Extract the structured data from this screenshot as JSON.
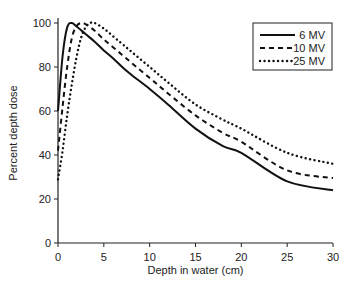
{
  "chart_data": {
    "type": "line",
    "title": "",
    "xlabel": "Depth in water (cm)",
    "ylabel": "Percent depth dose",
    "xlim": [
      0,
      30
    ],
    "ylim": [
      0,
      100
    ],
    "xticks": [
      0,
      5,
      10,
      15,
      20,
      25,
      30
    ],
    "yticks": [
      0,
      20,
      40,
      60,
      80,
      100
    ],
    "grid": false,
    "legend_position": "top-right",
    "series": [
      {
        "name": "6 MV",
        "style": "solid",
        "x": [
          0,
          0.5,
          1.0,
          1.5,
          2,
          3,
          4,
          5,
          6,
          7,
          8,
          10,
          12,
          15,
          18,
          20,
          25,
          30
        ],
        "y": [
          60,
          85,
          98,
          100,
          98.5,
          95,
          91.5,
          87.5,
          84,
          80,
          76.5,
          70,
          63,
          52,
          44,
          41,
          28,
          24
        ]
      },
      {
        "name": "10 MV",
        "style": "dashed",
        "x": [
          0,
          0.5,
          1.0,
          1.5,
          2.0,
          2.5,
          3,
          4,
          5,
          6,
          7,
          8,
          10,
          12,
          15,
          18,
          20,
          25,
          30
        ],
        "y": [
          42,
          62,
          80,
          93,
          98.5,
          100,
          99.5,
          96.5,
          92.5,
          89,
          85.5,
          82,
          75,
          68,
          58,
          50,
          46,
          33,
          29.5
        ]
      },
      {
        "name": "25 MV",
        "style": "dotted",
        "x": [
          0,
          0.5,
          1.0,
          1.5,
          2.0,
          2.5,
          3.0,
          3.5,
          4.0,
          5,
          6,
          7,
          8,
          10,
          12,
          15,
          18,
          20,
          25,
          30
        ],
        "y": [
          29,
          42,
          58,
          72,
          84,
          93,
          98,
          100,
          100,
          97.5,
          94,
          90.5,
          87,
          80,
          73,
          63,
          56,
          52,
          41,
          36
        ]
      }
    ]
  }
}
